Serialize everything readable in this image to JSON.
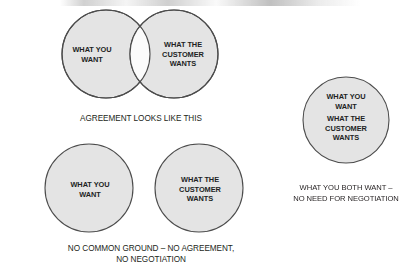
{
  "figure": {
    "colors": {
      "circle_fill": "#e4e4e4",
      "circle_stroke": "#4c4c4c",
      "overlap_fill": "#fbfbfb",
      "text": "#221f1f",
      "background": "#ffffff"
    }
  },
  "diagrams": [
    {
      "id": "agreement",
      "type": "two-overlapping-circles",
      "labels": [
        {
          "id": "you-want",
          "text": "WHAT YOU\nWANT"
        },
        {
          "id": "customer-wants",
          "text": "WHAT THE\nCUSTOMER\nWANTS"
        }
      ],
      "caption": "AGREEMENT LOOKS LIKE THIS"
    },
    {
      "id": "no-common-ground",
      "type": "two-separate-circles",
      "labels": [
        {
          "id": "you-want",
          "text": "WHAT YOU\nWANT"
        },
        {
          "id": "customer-wants",
          "text": "WHAT THE\nCUSTOMER\nWANTS"
        }
      ],
      "caption": "NO COMMON GROUND – NO AGREEMENT,\nNO NEGOTIATION"
    },
    {
      "id": "both-want",
      "type": "single-circle",
      "labels": [
        {
          "id": "you-want",
          "text": "WHAT YOU\nWANT"
        },
        {
          "id": "customer-wants",
          "text": "WHAT THE\nCUSTOMER\nWANTS"
        }
      ],
      "caption": "WHAT YOU BOTH WANT –\nNO NEED FOR NEGOTIATION"
    }
  ]
}
